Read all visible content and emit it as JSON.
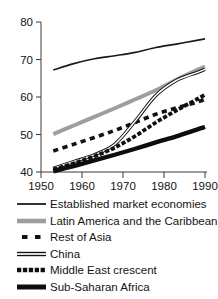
{
  "chart_data": {
    "type": "line",
    "title": "",
    "subtitle": "",
    "xlabel": "",
    "ylabel": "",
    "xlim": [
      1950,
      1990
    ],
    "ylim": [
      40,
      80
    ],
    "xticks": [
      1950,
      1960,
      1970,
      1980,
      1990
    ],
    "yticks": [
      40,
      50,
      60,
      70,
      80
    ],
    "grid": false,
    "legend_position": "below",
    "annotations": [],
    "x": [
      1953,
      1958,
      1963,
      1968,
      1973,
      1978,
      1983,
      1988,
      1990
    ],
    "series": [
      {
        "name": "Established market economies",
        "style": "thin-solid",
        "color": "#1a1a1a",
        "width": 1.6,
        "values": [
          67.2,
          68.9,
          70.2,
          71.0,
          71.9,
          73.2,
          74.1,
          75.1,
          75.5
        ]
      },
      {
        "name": "Latin America and the Caribbean",
        "style": "thick-solid-gray",
        "color": "#9e9e9e",
        "width": 4.0,
        "values": [
          50.1,
          52.4,
          54.7,
          57.0,
          59.4,
          61.8,
          64.6,
          67.2,
          68.1
        ]
      },
      {
        "name": "Rest of Asia",
        "style": "long-dash",
        "color": "#121212",
        "width": 3.6,
        "values": [
          45.6,
          47.4,
          49.2,
          51.1,
          53.2,
          55.4,
          57.1,
          58.6,
          59.4
        ]
      },
      {
        "name": "China",
        "style": "double-line",
        "color": "#111111",
        "width": 1.1,
        "values": [
          41.0,
          42.8,
          44.6,
          47.4,
          53.6,
          60.4,
          64.4,
          66.5,
          67.4
        ]
      },
      {
        "name": "Middle East crescent",
        "style": "short-dash",
        "color": "#101010",
        "width": 3.8,
        "values": [
          40.7,
          42.3,
          44.2,
          46.5,
          49.6,
          53.2,
          56.4,
          59.4,
          60.6
        ]
      },
      {
        "name": "Sub-Saharan Africa",
        "style": "very-thick-solid",
        "color": "#0d0d0d",
        "width": 4.4,
        "values": [
          40.2,
          41.6,
          43.1,
          44.6,
          46.2,
          47.9,
          49.5,
          51.3,
          52.0
        ]
      }
    ]
  },
  "axes": {
    "y_tick_labels": [
      "40",
      "50",
      "60",
      "70",
      "80"
    ],
    "x_tick_labels": [
      "1950",
      "1960",
      "1970",
      "1980",
      "1990"
    ]
  },
  "legend": {
    "items": [
      {
        "label": "Established market economies",
        "swatch": "thin-solid-line-swatch"
      },
      {
        "label": "Latin America and the Caribbean",
        "swatch": "thick-gray-line-swatch"
      },
      {
        "label": "Rest of Asia",
        "swatch": "long-dash-line-swatch"
      },
      {
        "label": "China",
        "swatch": "double-line-swatch"
      },
      {
        "label": "Middle East crescent",
        "swatch": "short-dash-line-swatch"
      },
      {
        "label": "Sub-Saharan Africa",
        "swatch": "very-thick-line-swatch"
      }
    ]
  },
  "colors": {
    "gray_series": "#9e9e9e",
    "black_series": "#121212",
    "axis": "#3a3a3a",
    "background": "#ffffff"
  }
}
